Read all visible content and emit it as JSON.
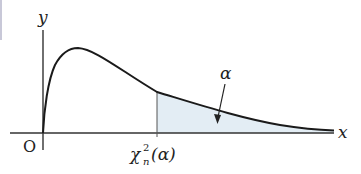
{
  "diagram": {
    "title": "",
    "labels": {
      "y_axis": "y",
      "x_axis": "x",
      "origin": "O",
      "critical_value_base": "χ",
      "critical_value_sup": "2",
      "critical_value_sub": "n",
      "critical_value_arg": "(α)",
      "area": "α"
    },
    "colors": {
      "curve": "#1a1a1a",
      "axis": "#333333",
      "shade": "#e3edf4",
      "text": "#222222"
    }
  }
}
